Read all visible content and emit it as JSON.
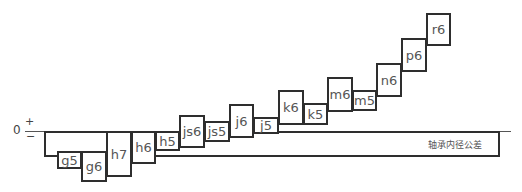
{
  "axis": {
    "zero": "0",
    "plus": "+",
    "minus": "−"
  },
  "bearing_bore": {
    "label": "轴承内径公差"
  },
  "fits": [
    {
      "label": "g5",
      "x": 57,
      "y": 151,
      "w": 25,
      "h": 18
    },
    {
      "label": "g6",
      "x": 81,
      "y": 151,
      "w": 26,
      "h": 31
    },
    {
      "label": "h7",
      "x": 106,
      "y": 131,
      "w": 26,
      "h": 46
    },
    {
      "label": "h6",
      "x": 131,
      "y": 131,
      "w": 25,
      "h": 33
    },
    {
      "label": "h5",
      "x": 155,
      "y": 131,
      "w": 25,
      "h": 20
    },
    {
      "label": "js6",
      "x": 179,
      "y": 115,
      "w": 26,
      "h": 33
    },
    {
      "label": "js5",
      "x": 204,
      "y": 121,
      "w": 26,
      "h": 21
    },
    {
      "label": "j6",
      "x": 229,
      "y": 104,
      "w": 25,
      "h": 34
    },
    {
      "label": "j5",
      "x": 253,
      "y": 117,
      "w": 26,
      "h": 17
    },
    {
      "label": "k6",
      "x": 278,
      "y": 90,
      "w": 26,
      "h": 35
    },
    {
      "label": "k5",
      "x": 303,
      "y": 103,
      "w": 25,
      "h": 22
    },
    {
      "label": "m6",
      "x": 327,
      "y": 77,
      "w": 26,
      "h": 35
    },
    {
      "label": "m5",
      "x": 352,
      "y": 90,
      "w": 25,
      "h": 21
    },
    {
      "label": "n6",
      "x": 376,
      "y": 63,
      "w": 26,
      "h": 34
    },
    {
      "label": "p6",
      "x": 401,
      "y": 38,
      "w": 26,
      "h": 34
    },
    {
      "label": "r6",
      "x": 426,
      "y": 13,
      "w": 25,
      "h": 33
    }
  ]
}
